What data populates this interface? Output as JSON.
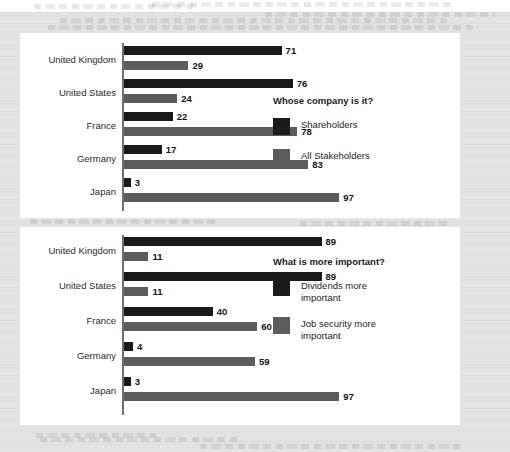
{
  "document": {
    "background_color": "#e3e3e3",
    "panel_color": "#ffffff"
  },
  "colors": {
    "series_dark": "#1a1a1a",
    "series_gray": "#5c5c5c",
    "axis": "#6f6f6f",
    "text": "#242424"
  },
  "charts": [
    {
      "id": "whose-company",
      "legend_title": "Whose company is it?",
      "legend": [
        {
          "label": "Shareholders",
          "color": "#1a1a1a",
          "swatch_name": "shareholders-swatch"
        },
        {
          "label": "All Stakeholders",
          "color": "#5c5c5c",
          "swatch_name": "all-stakeholders-swatch"
        }
      ]
    },
    {
      "id": "what-is-more-important",
      "legend_title": "What is more important?",
      "legend": [
        {
          "label": "Dividends more important",
          "color": "#1a1a1a",
          "swatch_name": "dividends-swatch"
        },
        {
          "label": "Job security more important",
          "color": "#5c5c5c",
          "swatch_name": "job-security-swatch"
        }
      ]
    }
  ],
  "chart_data": [
    {
      "type": "bar",
      "orientation": "horizontal",
      "title": "Whose company is it?",
      "xlabel": "",
      "ylabel": "",
      "xlim": [
        0,
        100
      ],
      "grid": false,
      "legend_position": "right",
      "categories": [
        "United Kingdom",
        "United States",
        "France",
        "Germany",
        "Japan"
      ],
      "series": [
        {
          "name": "Shareholders",
          "color": "#1a1a1a",
          "values": [
            71,
            76,
            22,
            17,
            3
          ]
        },
        {
          "name": "All Stakeholders",
          "color": "#5c5c5c",
          "values": [
            29,
            24,
            78,
            83,
            97
          ]
        }
      ]
    },
    {
      "type": "bar",
      "orientation": "horizontal",
      "title": "What is more important?",
      "xlabel": "",
      "ylabel": "",
      "xlim": [
        0,
        100
      ],
      "grid": false,
      "legend_position": "right",
      "categories": [
        "United Kingdom",
        "United States",
        "France",
        "Germany",
        "Japan"
      ],
      "series": [
        {
          "name": "Dividends more important",
          "color": "#1a1a1a",
          "values": [
            89,
            89,
            40,
            4,
            3
          ]
        },
        {
          "name": "Job security more important",
          "color": "#5c5c5c",
          "values": [
            11,
            11,
            60,
            59,
            97
          ]
        }
      ]
    }
  ]
}
